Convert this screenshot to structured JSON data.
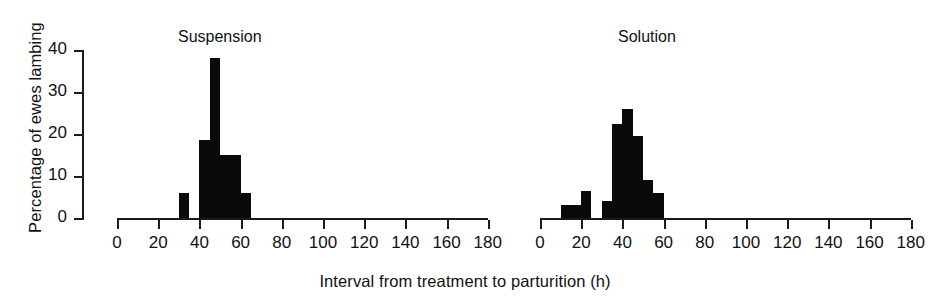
{
  "chart_data": {
    "type": "bar",
    "title": "",
    "xlabel": "Interval from treatment to parturition (h)",
    "ylabel": "Percentage of ewes lambing",
    "xlim": [
      0,
      180
    ],
    "ylim": [
      0,
      40
    ],
    "xticks": [
      0,
      20,
      40,
      60,
      80,
      100,
      120,
      140,
      160,
      180
    ],
    "xtick_labels": [
      "0",
      "20",
      "40",
      "60",
      "80",
      "100",
      "120",
      "140",
      "160",
      "180"
    ],
    "yticks": [
      0,
      10,
      20,
      30,
      40
    ],
    "ytick_labels": [
      "0",
      "10",
      "20",
      "30",
      "40"
    ],
    "grid": false,
    "legend": "none",
    "bin_width": 5,
    "bar_color": "#0a0a0a",
    "axis_color": "#1a1a1a",
    "panels": [
      {
        "name": "suspension",
        "title": "Suspension",
        "bins": [
          {
            "x0": 30,
            "x1": 35,
            "value": 6
          },
          {
            "x0": 40,
            "x1": 45,
            "value": 18.5
          },
          {
            "x0": 45,
            "x1": 50,
            "value": 38
          },
          {
            "x0": 50,
            "x1": 55,
            "value": 15
          },
          {
            "x0": 55,
            "x1": 60,
            "value": 15
          },
          {
            "x0": 60,
            "x1": 65,
            "value": 6
          }
        ]
      },
      {
        "name": "solution",
        "title": "Solution",
        "bins": [
          {
            "x0": 10,
            "x1": 15,
            "value": 3
          },
          {
            "x0": 15,
            "x1": 20,
            "value": 3
          },
          {
            "x0": 20,
            "x1": 25,
            "value": 6.5
          },
          {
            "x0": 30,
            "x1": 35,
            "value": 4
          },
          {
            "x0": 35,
            "x1": 40,
            "value": 22.5
          },
          {
            "x0": 40,
            "x1": 45,
            "value": 26
          },
          {
            "x0": 45,
            "x1": 50,
            "value": 19.5
          },
          {
            "x0": 50,
            "x1": 55,
            "value": 9
          },
          {
            "x0": 55,
            "x1": 60,
            "value": 6
          }
        ]
      }
    ]
  },
  "axes": {
    "ylabel": "Percentage of ewes lambing",
    "xlabel": "Interval from treatment to parturition (h)"
  },
  "panels": {
    "left_title": "Suspension",
    "right_title": "Solution"
  }
}
